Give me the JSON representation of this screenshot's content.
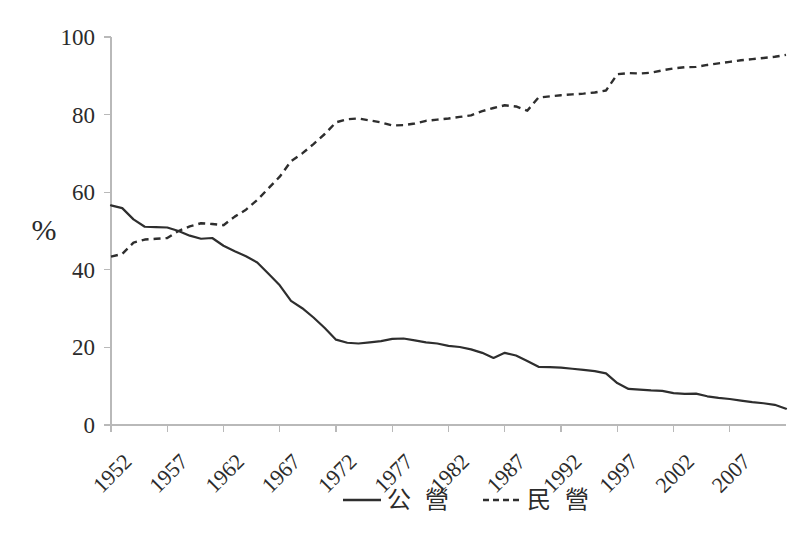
{
  "chart_data": {
    "type": "line",
    "title": "",
    "subtitle": "",
    "xlabel": "",
    "ylabel": "%",
    "ylim": [
      0,
      100
    ],
    "xlim": [
      1952,
      2012
    ],
    "grid": false,
    "legend_position": "bottom",
    "y_ticks": [
      "0",
      "20",
      "40",
      "60",
      "80",
      "100"
    ],
    "y_tick_values": [
      0,
      20,
      40,
      60,
      80,
      100
    ],
    "x_tick_labels": [
      "1952",
      "1957",
      "1962",
      "1967",
      "1972",
      "1977",
      "1982",
      "1987",
      "1992",
      "1997",
      "2002",
      "2007"
    ],
    "x_tick_values": [
      1952,
      1957,
      1962,
      1967,
      1972,
      1977,
      1982,
      1987,
      1992,
      1997,
      2002,
      2007
    ],
    "x": [
      1952,
      1953,
      1954,
      1955,
      1956,
      1957,
      1958,
      1959,
      1960,
      1961,
      1962,
      1963,
      1964,
      1965,
      1966,
      1967,
      1968,
      1969,
      1970,
      1971,
      1972,
      1973,
      1974,
      1975,
      1976,
      1977,
      1978,
      1979,
      1980,
      1981,
      1982,
      1983,
      1984,
      1985,
      1986,
      1987,
      1988,
      1989,
      1990,
      1991,
      1992,
      1993,
      1994,
      1995,
      1996,
      1997,
      1998,
      1999,
      2000,
      2001,
      2002,
      2003,
      2004,
      2005,
      2006,
      2007,
      2008,
      2009,
      2010,
      2011,
      2012
    ],
    "series": [
      {
        "name": "公 營",
        "style": "solid",
        "color": "#2e2e2e",
        "values": [
          56.6,
          55.9,
          53.0,
          51.1,
          51.0,
          50.9,
          50.0,
          48.8,
          48.0,
          48.2,
          46.2,
          44.8,
          43.5,
          41.9,
          39.0,
          36.0,
          32.0,
          30.1,
          27.7,
          25.0,
          22.0,
          21.2,
          21.0,
          21.3,
          21.6,
          22.2,
          22.3,
          21.8,
          21.3,
          21.0,
          20.4,
          20.1,
          19.5,
          18.6,
          17.3,
          18.6,
          17.9,
          16.5,
          15.0,
          14.9,
          14.8,
          14.5,
          14.2,
          13.9,
          13.3,
          10.8,
          9.3,
          9.1,
          8.9,
          8.8,
          8.2,
          8.0,
          8.1,
          7.4,
          7.0,
          6.7,
          6.3,
          5.9,
          5.6,
          5.2,
          4.2
        ]
      },
      {
        "name": "民 營",
        "style": "dashed",
        "color": "#2e2e2e",
        "values": [
          43.4,
          44.1,
          47.0,
          47.8,
          48.0,
          48.2,
          50.0,
          51.2,
          52.0,
          51.8,
          51.5,
          53.7,
          55.5,
          58.0,
          61.0,
          64.0,
          68.0,
          70.0,
          72.4,
          75.0,
          78.0,
          78.8,
          79.0,
          78.5,
          78.0,
          77.2,
          77.3,
          77.7,
          78.4,
          78.7,
          79.0,
          79.4,
          79.8,
          80.9,
          81.7,
          82.4,
          82.1,
          81.0,
          84.4,
          84.7,
          85.0,
          85.2,
          85.4,
          85.7,
          86.2,
          90.4,
          90.7,
          90.6,
          90.8,
          91.4,
          91.9,
          92.2,
          92.3,
          92.8,
          93.2,
          93.6,
          94.0,
          94.3,
          94.6,
          94.9,
          95.4
        ]
      }
    ]
  },
  "legend": {
    "items": [
      {
        "label": "公 營",
        "style": "solid"
      },
      {
        "label": "民 營",
        "style": "dashed"
      }
    ]
  }
}
